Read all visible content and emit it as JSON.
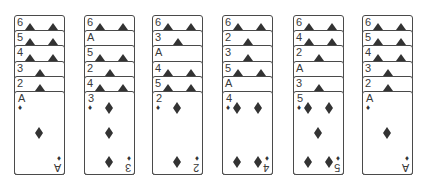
{
  "game": {
    "type": "card-stacks",
    "suit_colors": {
      "diamond": "#333333",
      "spade_tri": "#333333"
    },
    "piles": [
      {
        "stack": [
          "6",
          "5",
          "4",
          "3",
          "2"
        ],
        "face": {
          "rank": "A",
          "suit": "diamond",
          "pips": 1
        }
      },
      {
        "stack": [
          "6",
          "A",
          "5",
          "2",
          "4"
        ],
        "face": {
          "rank": "3",
          "suit": "diamond",
          "pips": 3
        }
      },
      {
        "stack": [
          "6",
          "3",
          "A",
          "4",
          "5"
        ],
        "face": {
          "rank": "2",
          "suit": "diamond",
          "pips": 2
        }
      },
      {
        "stack": [
          "6",
          "2",
          "3",
          "5",
          "A"
        ],
        "face": {
          "rank": "4",
          "suit": "diamond",
          "pips": 4
        }
      },
      {
        "stack": [
          "6",
          "4",
          "2",
          "A",
          "3"
        ],
        "face": {
          "rank": "5",
          "suit": "diamond",
          "pips": 5
        }
      },
      {
        "stack": [
          "6",
          "5",
          "4",
          "3",
          "2"
        ],
        "face": {
          "rank": "A",
          "suit": "diamond",
          "pips": 1
        }
      }
    ]
  }
}
